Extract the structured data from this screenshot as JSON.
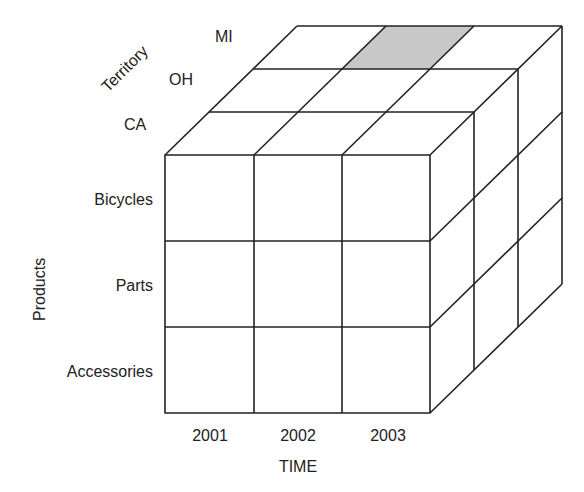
{
  "diagram": {
    "type": "olap-cube",
    "axes": {
      "vertical": {
        "title": "Products",
        "members": [
          "Bicycles",
          "Parts",
          "Accessories"
        ]
      },
      "horizontal": {
        "title": "TIME",
        "members": [
          "2001",
          "2002",
          "2003"
        ]
      },
      "depth": {
        "title": "Territory",
        "members": [
          "CA",
          "OH",
          "MI"
        ]
      }
    },
    "highlighted_cell": {
      "time": "2002",
      "territory": "MI",
      "face": "top"
    },
    "colors": {
      "line": "#222222",
      "highlight": "#c8c8c8",
      "background": "#ffffff"
    }
  }
}
